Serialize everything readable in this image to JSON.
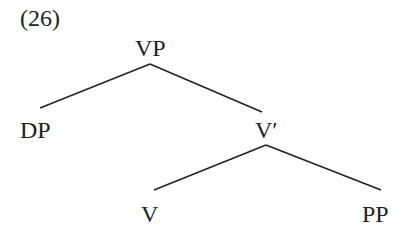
{
  "example_number": "(26)",
  "tree": {
    "root": "VP",
    "left_child": "DP",
    "right_child": "V′",
    "right_left": "V",
    "right_right": "PP"
  },
  "colors": {
    "line": "#222222",
    "text": "#222222",
    "background": "#ffffff"
  }
}
